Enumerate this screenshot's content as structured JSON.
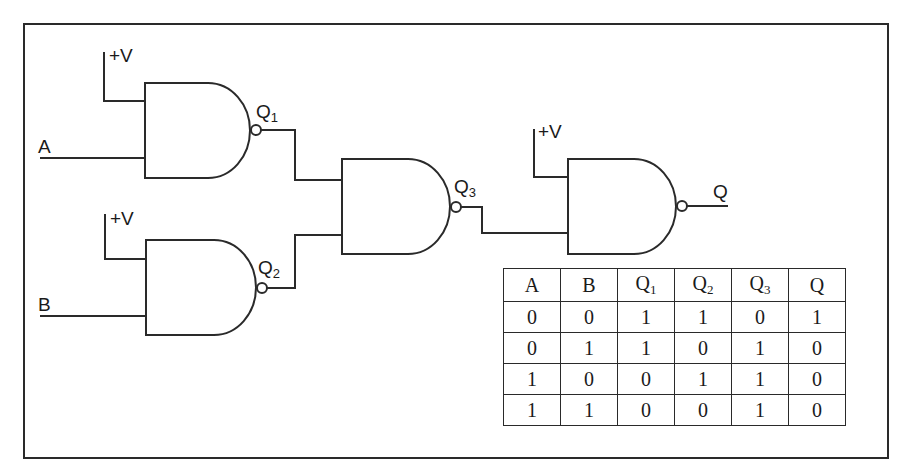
{
  "diagram": {
    "type": "logic-circuit",
    "colors": {
      "line": "#2a2a2a",
      "background": "#ffffff"
    },
    "inputs": [
      {
        "id": "A",
        "label": "A"
      },
      {
        "id": "B",
        "label": "B"
      }
    ],
    "supply_labels": [
      "+V",
      "+V",
      "+V"
    ],
    "gates": [
      {
        "id": "g1",
        "type": "NAND",
        "inputs": [
          "+V",
          "A"
        ],
        "output": "Q1",
        "output_label": "Q",
        "output_sub": "1"
      },
      {
        "id": "g2",
        "type": "NAND",
        "inputs": [
          "+V",
          "B"
        ],
        "output": "Q2",
        "output_label": "Q",
        "output_sub": "2"
      },
      {
        "id": "g3",
        "type": "NAND",
        "inputs": [
          "Q1",
          "Q2"
        ],
        "output": "Q3",
        "output_label": "Q",
        "output_sub": "3"
      },
      {
        "id": "g4",
        "type": "NAND",
        "inputs": [
          "+V",
          "Q3"
        ],
        "output": "Q",
        "output_label": "Q",
        "output_sub": ""
      }
    ]
  },
  "truth_table": {
    "headers": [
      {
        "main": "A",
        "sub": ""
      },
      {
        "main": "B",
        "sub": ""
      },
      {
        "main": "Q",
        "sub": "1"
      },
      {
        "main": "Q",
        "sub": "2"
      },
      {
        "main": "Q",
        "sub": "3"
      },
      {
        "main": "Q",
        "sub": ""
      }
    ],
    "rows": [
      [
        "0",
        "0",
        "1",
        "1",
        "0",
        "1"
      ],
      [
        "0",
        "1",
        "1",
        "0",
        "1",
        "0"
      ],
      [
        "1",
        "0",
        "0",
        "1",
        "1",
        "0"
      ],
      [
        "1",
        "1",
        "0",
        "0",
        "1",
        "0"
      ]
    ]
  }
}
